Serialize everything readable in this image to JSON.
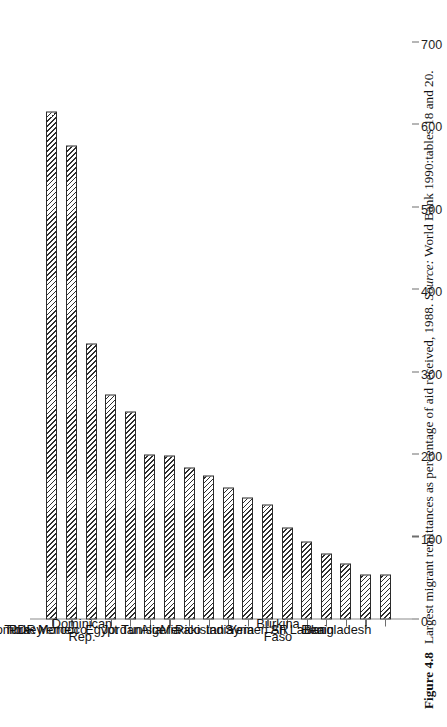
{
  "figure": {
    "number_label": "Figure 4.8",
    "caption_text": "Largest migrant remittances as percentage of aid received, 1988.",
    "source_word": "Source:",
    "source_text": "World Bank 1990:tables 18 and 20."
  },
  "chart_data": {
    "type": "bar",
    "orientation": "vertical-printed-sideways",
    "title": "Largest migrant remittances as percentage of aid received, 1988",
    "xlabel": "",
    "ylabel": "",
    "ylim": [
      0,
      700
    ],
    "grid": false,
    "legend": "none",
    "tick_labels": [
      "0",
      "100",
      "200",
      "300",
      "400",
      "500",
      "600",
      "700"
    ],
    "ticks": [
      0,
      100,
      200,
      300,
      400,
      500,
      600,
      700
    ],
    "categories": [
      "Colombia",
      "Turkey",
      "PDR Yemen",
      "Morocco",
      "Dominican\nRep.",
      "Egypt",
      "Jordan",
      "Tunisia",
      "Algeria",
      "Mexico",
      "Pakistan",
      "India",
      "Syria",
      "Yemen AR",
      "Burkina\nFaso",
      "Sri Lanka",
      "Benin",
      "Bangladesh"
    ],
    "values": [
      616,
      575,
      335,
      273,
      252,
      200,
      199,
      185,
      175,
      160,
      148,
      140,
      112,
      95,
      80,
      68,
      55,
      54
    ],
    "bar_fill": "#ffffff",
    "bar_edge": "#2b2b2b",
    "hatch": "diagonal-45"
  }
}
